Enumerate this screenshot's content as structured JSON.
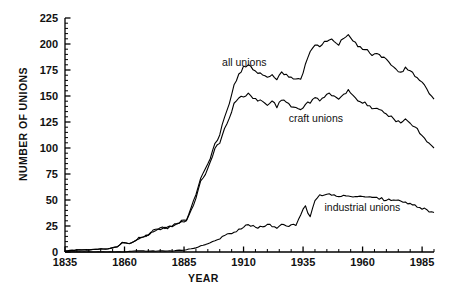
{
  "chart_data": {
    "type": "line",
    "title": "",
    "xlabel": "YEAR",
    "ylabel": "NUMBER OF UNIONS",
    "xlim": [
      1835,
      1990
    ],
    "ylim": [
      0,
      225
    ],
    "xticks": [
      1835,
      1860,
      1885,
      1910,
      1935,
      1960,
      1985
    ],
    "yticks": [
      0,
      25,
      50,
      75,
      100,
      125,
      150,
      175,
      200,
      225
    ],
    "grid": false,
    "legend_position": "inline-annotations",
    "minor_ticks": {
      "x_every": 5,
      "y_every": 5
    },
    "annotations": [
      {
        "text": "all unions",
        "x": 1901,
        "y": 182
      },
      {
        "text": "craft unions",
        "x": 1929,
        "y": 128
      },
      {
        "text": "industrial unions",
        "x": 1944,
        "y": 42
      }
    ],
    "series": [
      {
        "name": "all unions",
        "color": "#000000",
        "x": [
          1835,
          1840,
          1845,
          1850,
          1853,
          1855,
          1857,
          1858,
          1859,
          1860,
          1862,
          1864,
          1866,
          1868,
          1870,
          1872,
          1874,
          1876,
          1878,
          1880,
          1882,
          1884,
          1886,
          1888,
          1890,
          1892,
          1894,
          1896,
          1898,
          1900,
          1902,
          1904,
          1906,
          1908,
          1910,
          1912,
          1914,
          1916,
          1918,
          1920,
          1922,
          1924,
          1926,
          1928,
          1930,
          1932,
          1934,
          1936,
          1938,
          1940,
          1942,
          1944,
          1946,
          1948,
          1950,
          1952,
          1954,
          1956,
          1958,
          1960,
          1962,
          1964,
          1966,
          1968,
          1970,
          1972,
          1974,
          1976,
          1978,
          1980,
          1982,
          1984,
          1986,
          1988,
          1990
        ],
        "y": [
          1,
          2,
          2,
          3,
          3,
          4,
          5,
          7,
          9,
          9,
          8,
          10,
          13,
          15,
          17,
          20,
          22,
          23,
          23,
          25,
          28,
          30,
          30,
          42,
          55,
          72,
          80,
          90,
          105,
          112,
          130,
          142,
          160,
          170,
          178,
          180,
          176,
          172,
          170,
          168,
          170,
          166,
          172,
          170,
          168,
          166,
          165,
          180,
          192,
          200,
          198,
          202,
          205,
          203,
          200,
          206,
          208,
          203,
          198,
          196,
          194,
          190,
          190,
          188,
          185,
          180,
          175,
          172,
          177,
          174,
          170,
          165,
          160,
          152,
          147
        ]
      },
      {
        "name": "craft unions",
        "color": "#000000",
        "x": [
          1835,
          1840,
          1845,
          1850,
          1853,
          1855,
          1857,
          1858,
          1859,
          1860,
          1862,
          1864,
          1866,
          1868,
          1870,
          1872,
          1874,
          1876,
          1878,
          1880,
          1882,
          1884,
          1886,
          1888,
          1890,
          1892,
          1894,
          1896,
          1898,
          1900,
          1902,
          1904,
          1906,
          1908,
          1910,
          1912,
          1914,
          1916,
          1918,
          1920,
          1922,
          1924,
          1926,
          1928,
          1930,
          1932,
          1934,
          1936,
          1938,
          1940,
          1942,
          1944,
          1946,
          1948,
          1950,
          1952,
          1954,
          1956,
          1958,
          1960,
          1962,
          1964,
          1966,
          1968,
          1970,
          1972,
          1974,
          1976,
          1978,
          1980,
          1982,
          1984,
          1986,
          1988,
          1990
        ],
        "y": [
          1,
          2,
          2,
          3,
          3,
          4,
          5,
          7,
          9,
          9,
          8,
          10,
          13,
          15,
          17,
          20,
          22,
          23,
          23,
          25,
          28,
          30,
          30,
          40,
          52,
          68,
          75,
          86,
          100,
          105,
          118,
          128,
          142,
          148,
          150,
          152,
          148,
          146,
          144,
          142,
          145,
          140,
          146,
          144,
          140,
          138,
          136,
          142,
          144,
          148,
          146,
          150,
          152,
          150,
          148,
          152,
          155,
          150,
          146,
          144,
          142,
          138,
          138,
          136,
          133,
          130,
          126,
          124,
          128,
          124,
          120,
          115,
          110,
          104,
          100
        ]
      },
      {
        "name": "industrial unions",
        "color": "#000000",
        "x": [
          1835,
          1845,
          1855,
          1860,
          1865,
          1870,
          1875,
          1880,
          1885,
          1888,
          1890,
          1892,
          1894,
          1896,
          1898,
          1900,
          1902,
          1904,
          1906,
          1908,
          1910,
          1912,
          1914,
          1916,
          1918,
          1920,
          1922,
          1924,
          1926,
          1928,
          1930,
          1932,
          1934,
          1936,
          1938,
          1940,
          1942,
          1944,
          1946,
          1948,
          1950,
          1952,
          1954,
          1956,
          1958,
          1960,
          1962,
          1964,
          1966,
          1968,
          1970,
          1972,
          1974,
          1976,
          1978,
          1980,
          1982,
          1984,
          1986,
          1988,
          1990
        ],
        "y": [
          0,
          0,
          0,
          0,
          1,
          1,
          1,
          1,
          2,
          3,
          4,
          6,
          7,
          9,
          11,
          13,
          15,
          17,
          19,
          21,
          24,
          26,
          25,
          24,
          25,
          26,
          25,
          24,
          26,
          25,
          26,
          25,
          36,
          44,
          33,
          50,
          54,
          55,
          56,
          55,
          54,
          55,
          54,
          53,
          54,
          53,
          52,
          53,
          52,
          51,
          50,
          50,
          49,
          49,
          48,
          47,
          45,
          43,
          41,
          39,
          38
        ]
      }
    ]
  }
}
